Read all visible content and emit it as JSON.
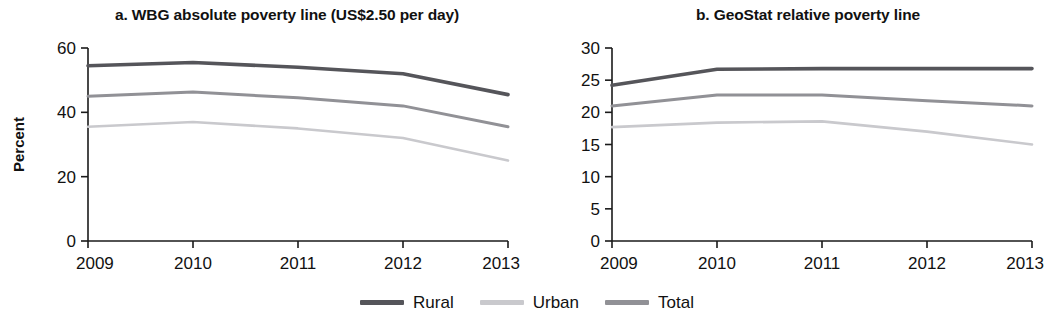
{
  "legend": {
    "position": "bottom-center",
    "items": [
      {
        "label": "Rural",
        "color": "#55555a"
      },
      {
        "label": "Urban",
        "color": "#c9c9cd"
      },
      {
        "label": "Total",
        "color": "#919196"
      }
    ]
  },
  "chart_data": [
    {
      "type": "line",
      "panel": "a",
      "title": "a. WBG absolute poverty line (US$2.50 per day)",
      "xlabel": "",
      "ylabel": "Percent",
      "categories": [
        "2009",
        "2010",
        "2011",
        "2012",
        "2013"
      ],
      "x": [
        2009,
        2010,
        2011,
        2012,
        2013
      ],
      "xlim": [
        2009,
        2013
      ],
      "ylim": [
        0,
        60
      ],
      "yticks": [
        0,
        20,
        40,
        60
      ],
      "ytick_labels": [
        "0",
        "20",
        "40",
        "60"
      ],
      "xtick_labels": [
        "2009",
        "2010",
        "2011",
        "2012",
        "2013"
      ],
      "grid": false,
      "series": [
        {
          "name": "Rural",
          "color": "#55555a",
          "values": [
            54.5,
            55.5,
            54.0,
            52.0,
            45.5
          ]
        },
        {
          "name": "Total",
          "color": "#919196",
          "values": [
            45.0,
            46.3,
            44.5,
            42.0,
            35.5
          ]
        },
        {
          "name": "Urban",
          "color": "#c9c9cd",
          "values": [
            35.5,
            37.0,
            35.0,
            32.0,
            25.0
          ]
        }
      ]
    },
    {
      "type": "line",
      "panel": "b",
      "title": "b. GeoStat relative poverty line",
      "xlabel": "",
      "ylabel": "Percent",
      "categories": [
        "2009",
        "2010",
        "2011",
        "2012",
        "2013"
      ],
      "x": [
        2009,
        2010,
        2011,
        2012,
        2013
      ],
      "xlim": [
        2009,
        2013
      ],
      "ylim": [
        0,
        30
      ],
      "yticks": [
        0,
        5,
        10,
        15,
        20,
        25,
        30
      ],
      "ytick_labels": [
        "0",
        "5",
        "10",
        "15",
        "20",
        "25",
        "30"
      ],
      "xtick_labels": [
        "2009",
        "2010",
        "2011",
        "2012",
        "2013"
      ],
      "grid": false,
      "series": [
        {
          "name": "Rural",
          "color": "#55555a",
          "values": [
            24.2,
            26.7,
            26.8,
            26.8,
            26.8
          ]
        },
        {
          "name": "Total",
          "color": "#919196",
          "values": [
            21.0,
            22.7,
            22.7,
            21.8,
            21.0
          ]
        },
        {
          "name": "Urban",
          "color": "#c9c9cd",
          "values": [
            17.7,
            18.4,
            18.6,
            17.0,
            15.0
          ]
        }
      ]
    }
  ]
}
